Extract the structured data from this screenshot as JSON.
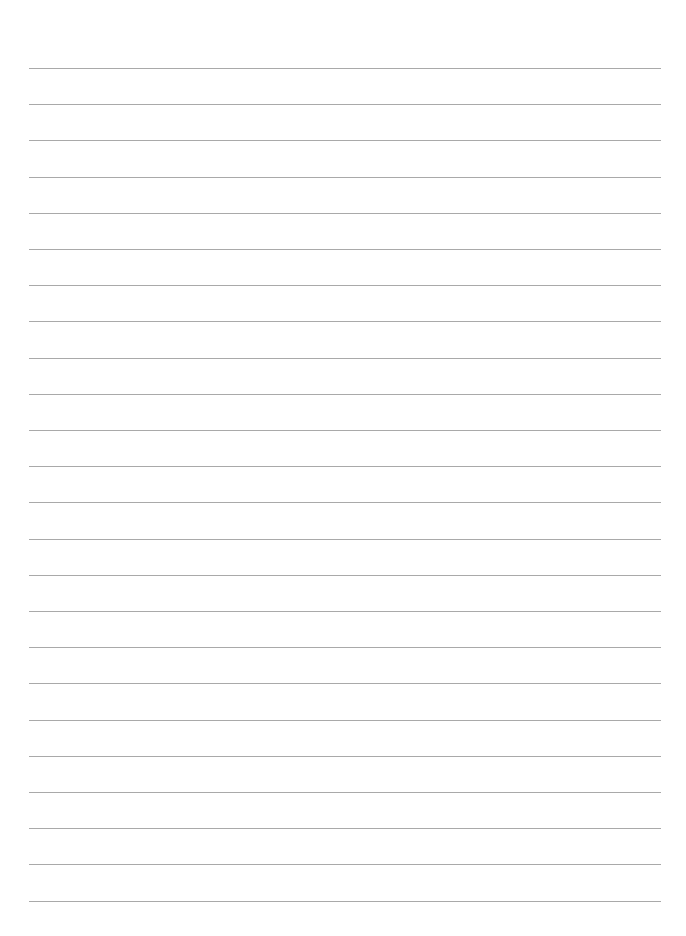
{
  "page": {
    "type": "ruled-paper",
    "background_color": "#ffffff",
    "line_color": "#9a9a9a",
    "line_count": 24,
    "first_line_y": 68,
    "line_spacing": 36.2,
    "line_left": 29,
    "line_right": 661
  }
}
